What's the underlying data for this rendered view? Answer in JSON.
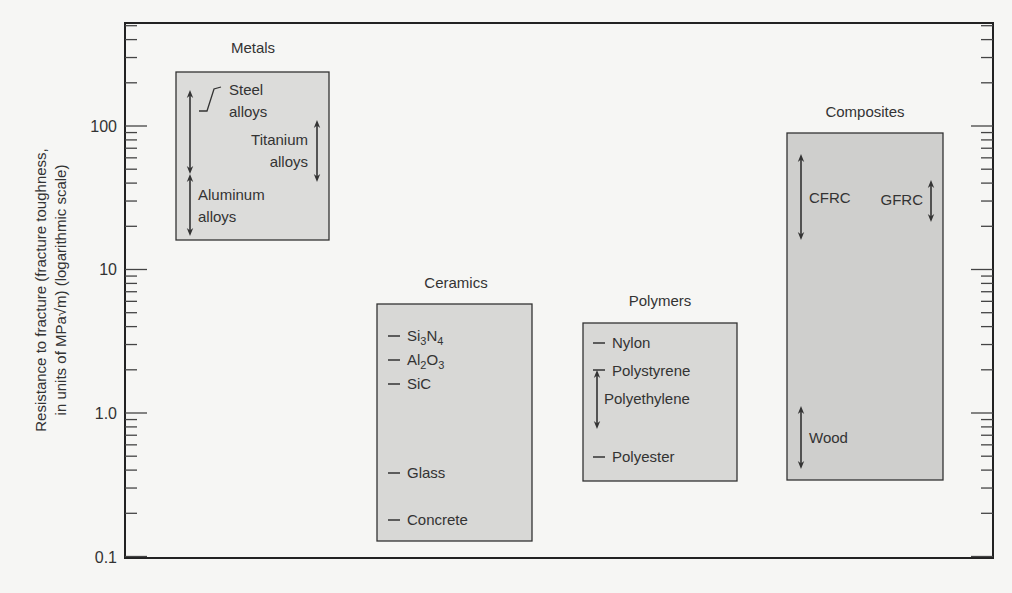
{
  "chart_data": {
    "type": "range-bar",
    "title": "",
    "xlabel": "",
    "ylabel_line1": "Resistance to fracture (fracture toughness,",
    "ylabel_line2": "in units of MPa√m) (logarithmic scale)",
    "yscale": "log",
    "ylim": [
      0.1,
      300
    ],
    "yticks": [
      {
        "value": 0.1,
        "label": "0.1"
      },
      {
        "value": 1.0,
        "label": "1.0"
      },
      {
        "value": 10,
        "label": "10"
      },
      {
        "value": 100,
        "label": "100"
      }
    ],
    "grid": false,
    "legend": "none",
    "categories": [
      {
        "name": "Metals",
        "range": [
          16,
          240
        ],
        "materials": [
          {
            "name": "Steel alloys",
            "range": [
              40,
              160
            ],
            "marker": "arrow"
          },
          {
            "name": "Titanium alloys",
            "range": [
              44,
              105
            ],
            "marker": "arrow"
          },
          {
            "name": "Aluminum alloys",
            "range": [
              18,
              48
            ],
            "marker": "arrow"
          }
        ]
      },
      {
        "name": "Ceramics",
        "range": [
          0.13,
          5.7
        ],
        "materials": [
          {
            "name": "Si3N4",
            "value": 4.5,
            "marker": "dash"
          },
          {
            "name": "Al2O3",
            "value": 3.5,
            "marker": "dash"
          },
          {
            "name": "SiC",
            "value": 2.8,
            "marker": "dash"
          },
          {
            "name": "Glass",
            "value": 0.35,
            "marker": "dash"
          },
          {
            "name": "Concrete",
            "value": 0.15,
            "marker": "dash"
          }
        ]
      },
      {
        "name": "Polymers",
        "range": [
          0.34,
          4.2
        ],
        "materials": [
          {
            "name": "Nylon",
            "value": 3.0,
            "marker": "dash"
          },
          {
            "name": "Polystyrene",
            "value": 2.1,
            "marker": "dash"
          },
          {
            "name": "Polyethylene",
            "range": [
              0.9,
              2.0
            ],
            "marker": "arrow"
          },
          {
            "name": "Polyester",
            "value": 0.55,
            "marker": "dash"
          }
        ]
      },
      {
        "name": "Composites",
        "range": [
          0.34,
          89
        ],
        "materials": [
          {
            "name": "CFRC",
            "range": [
              15,
              68
            ],
            "marker": "arrow"
          },
          {
            "name": "GFRC",
            "range": [
              30,
              46
            ],
            "marker": "arrow"
          },
          {
            "name": "Wood",
            "range": [
              0.37,
              1.3
            ],
            "marker": "arrow"
          }
        ]
      }
    ]
  },
  "labels": {
    "metals": "Metals",
    "ceramics": "Ceramics",
    "polymers": "Polymers",
    "composites": "Composites",
    "steel_1": "Steel",
    "steel_2": "alloys",
    "titanium_1": "Titanium",
    "titanium_2": "alloys",
    "aluminum_1": "Aluminum",
    "aluminum_2": "alloys",
    "si3n4_a": "Si",
    "si3n4_b": "3",
    "si3n4_c": "N",
    "si3n4_d": "4",
    "al2o3_a": "Al",
    "al2o3_b": "2",
    "al2o3_c": "O",
    "al2o3_d": "3",
    "sic": "SiC",
    "glass": "Glass",
    "concrete": "Concrete",
    "nylon": "Nylon",
    "polystyrene": "Polystyrene",
    "polyethylene": "Polyethylene",
    "polyester": "Polyester",
    "cfrc": "CFRC",
    "gfrc": "GFRC",
    "wood": "Wood"
  },
  "colors": {
    "box_fill": "#d6d6d4",
    "box_fill_dark": "#c9c9c7",
    "axis": "#222222",
    "background": "#f6f6f4"
  }
}
